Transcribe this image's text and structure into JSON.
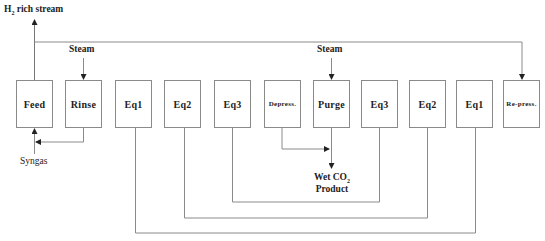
{
  "diagram": {
    "type": "process-flow",
    "steps": [
      {
        "id": "feed",
        "label": "Feed"
      },
      {
        "id": "rinse",
        "label": "Rinse"
      },
      {
        "id": "eq1-a",
        "label": "Eq1"
      },
      {
        "id": "eq2-a",
        "label": "Eq2"
      },
      {
        "id": "eq3-a",
        "label": "Eq3"
      },
      {
        "id": "depress",
        "label": "Depress."
      },
      {
        "id": "purge",
        "label": "Purge"
      },
      {
        "id": "eq3-b",
        "label": "Eq3"
      },
      {
        "id": "eq2-b",
        "label": "Eq2"
      },
      {
        "id": "eq1-b",
        "label": "Eq1"
      },
      {
        "id": "repress",
        "label": "Re-press."
      }
    ],
    "streams": {
      "h2_prefix": "H",
      "h2_sub": "2",
      "h2_suffix": " rich stream",
      "steam_rinse": "Steam",
      "steam_purge": "Steam",
      "syngas": "Syngas",
      "co2_prefix": "Wet CO",
      "co2_sub": "2",
      "co2_line2": "Product"
    },
    "connections": [
      {
        "from": "feed",
        "to": "H2 rich stream"
      },
      {
        "from": "feed",
        "to": "repress"
      },
      {
        "from": "Steam",
        "to": "rinse"
      },
      {
        "from": "Steam",
        "to": "purge"
      },
      {
        "from": "Syngas",
        "to": "feed"
      },
      {
        "from": "rinse",
        "to": "feed"
      },
      {
        "from": "depress",
        "to": "Wet CO2 Product"
      },
      {
        "from": "purge",
        "to": "Wet CO2 Product"
      },
      {
        "from": "eq3-b",
        "to": "eq3-a"
      },
      {
        "from": "eq2-b",
        "to": "eq2-a"
      },
      {
        "from": "eq1-b",
        "to": "eq1-a"
      }
    ]
  }
}
